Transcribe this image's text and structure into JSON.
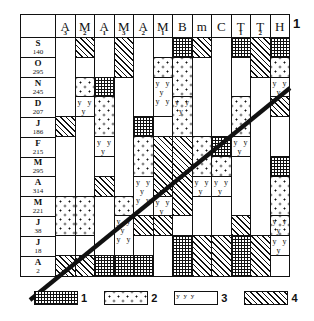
{
  "figure": {
    "corner_number": "1",
    "columns": [
      {
        "label": "A",
        "sub": "3"
      },
      {
        "label": "M",
        "sub": "2"
      },
      {
        "label": "A",
        "sub": "1"
      },
      {
        "label": "M",
        "sub": "3"
      },
      {
        "label": "A",
        "sub": "2"
      },
      {
        "label": "M",
        "sub": "1"
      },
      {
        "label": "B",
        "sub": ""
      },
      {
        "label": "m",
        "sub": ""
      },
      {
        "label": "C",
        "sub": ""
      },
      {
        "label": "T",
        "sub": "1"
      },
      {
        "label": "T",
        "sub": "2"
      },
      {
        "label": "H",
        "sub": ""
      }
    ],
    "rows": [
      {
        "letter": "S",
        "value": "140"
      },
      {
        "letter": "O",
        "value": "295"
      },
      {
        "letter": "N",
        "value": "245"
      },
      {
        "letter": "D",
        "value": "207"
      },
      {
        "letter": "J",
        "value": "186"
      },
      {
        "letter": "F",
        "value": "215"
      },
      {
        "letter": "M",
        "value": "295"
      },
      {
        "letter": "A",
        "value": "314"
      },
      {
        "letter": "M",
        "value": "221"
      },
      {
        "letter": "J",
        "value": "38"
      },
      {
        "letter": "J",
        "value": "18"
      },
      {
        "letter": "A",
        "value": "2"
      }
    ],
    "legend": [
      {
        "pattern": "grid",
        "number": "1"
      },
      {
        "pattern": "dots",
        "number": "2"
      },
      {
        "pattern": "y",
        "number": "3"
      },
      {
        "pattern": "hatch",
        "number": "4"
      }
    ]
  },
  "chart_data": {
    "type": "table",
    "xlabel": "",
    "ylabel": "",
    "categories": [
      "A3",
      "M2",
      "A1",
      "M3",
      "A2",
      "M1",
      "B",
      "m",
      "C",
      "T1",
      "T2",
      "H"
    ],
    "row_categories": [
      "S 140",
      "O 295",
      "N 245",
      "D 207",
      "J 186",
      "F 215",
      "M 295",
      "A 314",
      "M 221",
      "J 38",
      "J 18",
      "A 2"
    ],
    "pattern_legend": {
      "1": "grid",
      "2": "dots",
      "3": "y",
      "4": "hatch",
      "0": "blank"
    },
    "annotations": [
      "diagonal trend line rising left-to-right across the panel"
    ],
    "series": [
      {
        "name": "A3",
        "segments": [
          {
            "pattern": "blank",
            "rows": 4
          },
          {
            "pattern": "hatch",
            "rows": 1
          },
          {
            "pattern": "blank",
            "rows": 3
          },
          {
            "pattern": "dots",
            "rows": 2
          },
          {
            "pattern": "blank",
            "rows": 1
          },
          {
            "pattern": "hatch",
            "rows": 1
          }
        ]
      },
      {
        "name": "M2",
        "segments": [
          {
            "pattern": "hatch",
            "rows": 1
          },
          {
            "pattern": "blank",
            "rows": 1
          },
          {
            "pattern": "dots",
            "rows": 1
          },
          {
            "pattern": "y",
            "rows": 1
          },
          {
            "pattern": "blank",
            "rows": 4
          },
          {
            "pattern": "dots",
            "rows": 2
          },
          {
            "pattern": "blank",
            "rows": 1
          },
          {
            "pattern": "hatch",
            "rows": 1
          }
        ]
      },
      {
        "name": "A1",
        "segments": [
          {
            "pattern": "blank",
            "rows": 2
          },
          {
            "pattern": "grid",
            "rows": 1
          },
          {
            "pattern": "dots",
            "rows": 2
          },
          {
            "pattern": "y",
            "rows": 1
          },
          {
            "pattern": "blank",
            "rows": 1
          },
          {
            "pattern": "hatch",
            "rows": 1
          },
          {
            "pattern": "blank",
            "rows": 3
          },
          {
            "pattern": "grid",
            "rows": 1
          }
        ]
      },
      {
        "name": "M3",
        "segments": [
          {
            "pattern": "hatch",
            "rows": 2
          },
          {
            "pattern": "blank",
            "rows": 6
          },
          {
            "pattern": "dots",
            "rows": 1
          },
          {
            "pattern": "y",
            "rows": 2
          },
          {
            "pattern": "grid",
            "rows": 1
          }
        ]
      },
      {
        "name": "A2",
        "segments": [
          {
            "pattern": "blank",
            "rows": 4
          },
          {
            "pattern": "grid",
            "rows": 1
          },
          {
            "pattern": "dots",
            "rows": 2
          },
          {
            "pattern": "y",
            "rows": 2
          },
          {
            "pattern": "hatch",
            "rows": 1
          },
          {
            "pattern": "blank",
            "rows": 1
          },
          {
            "pattern": "grid",
            "rows": 1
          }
        ]
      },
      {
        "name": "M1",
        "segments": [
          {
            "pattern": "blank",
            "rows": 1
          },
          {
            "pattern": "dots",
            "rows": 1
          },
          {
            "pattern": "y",
            "rows": 2
          },
          {
            "pattern": "blank",
            "rows": 1
          },
          {
            "pattern": "hatch",
            "rows": 3
          },
          {
            "pattern": "y",
            "rows": 1
          },
          {
            "pattern": "hatch",
            "rows": 1
          },
          {
            "pattern": "blank",
            "rows": 2
          }
        ]
      },
      {
        "name": "B",
        "segments": [
          {
            "pattern": "grid",
            "rows": 1
          },
          {
            "pattern": "dots",
            "rows": 2
          },
          {
            "pattern": "ydots",
            "rows": 2
          },
          {
            "pattern": "hatch",
            "rows": 4
          },
          {
            "pattern": "blank",
            "rows": 1
          },
          {
            "pattern": "grid",
            "rows": 2
          }
        ]
      },
      {
        "name": "m",
        "segments": [
          {
            "pattern": "hatch",
            "rows": 1
          },
          {
            "pattern": "blank",
            "rows": 4
          },
          {
            "pattern": "dots",
            "rows": 2
          },
          {
            "pattern": "y",
            "rows": 1
          },
          {
            "pattern": "blank",
            "rows": 2
          },
          {
            "pattern": "hatch",
            "rows": 2
          }
        ]
      },
      {
        "name": "C",
        "segments": [
          {
            "pattern": "blank",
            "rows": 5
          },
          {
            "pattern": "grid",
            "rows": 1
          },
          {
            "pattern": "dots",
            "rows": 1
          },
          {
            "pattern": "y",
            "rows": 1
          },
          {
            "pattern": "blank",
            "rows": 2
          },
          {
            "pattern": "hatch",
            "rows": 2
          }
        ]
      },
      {
        "name": "T1",
        "segments": [
          {
            "pattern": "grid",
            "rows": 1
          },
          {
            "pattern": "blank",
            "rows": 2
          },
          {
            "pattern": "dots",
            "rows": 2
          },
          {
            "pattern": "y",
            "rows": 1
          },
          {
            "pattern": "blank",
            "rows": 3
          },
          {
            "pattern": "hatch",
            "rows": 1
          },
          {
            "pattern": "grid",
            "rows": 2
          }
        ]
      },
      {
        "name": "T2",
        "segments": [
          {
            "pattern": "hatch",
            "rows": 2
          },
          {
            "pattern": "blank",
            "rows": 8
          },
          {
            "pattern": "hatch",
            "rows": 2
          }
        ]
      },
      {
        "name": "H",
        "segments": [
          {
            "pattern": "grid",
            "rows": 1
          },
          {
            "pattern": "dots",
            "rows": 1
          },
          {
            "pattern": "y",
            "rows": 1
          },
          {
            "pattern": "hatch",
            "rows": 1
          },
          {
            "pattern": "blank",
            "rows": 2
          },
          {
            "pattern": "grid",
            "rows": 1
          },
          {
            "pattern": "dots",
            "rows": 2
          },
          {
            "pattern": "ydots",
            "rows": 1
          },
          {
            "pattern": "y",
            "rows": 1
          },
          {
            "pattern": "blank",
            "rows": 1
          }
        ]
      }
    ]
  }
}
